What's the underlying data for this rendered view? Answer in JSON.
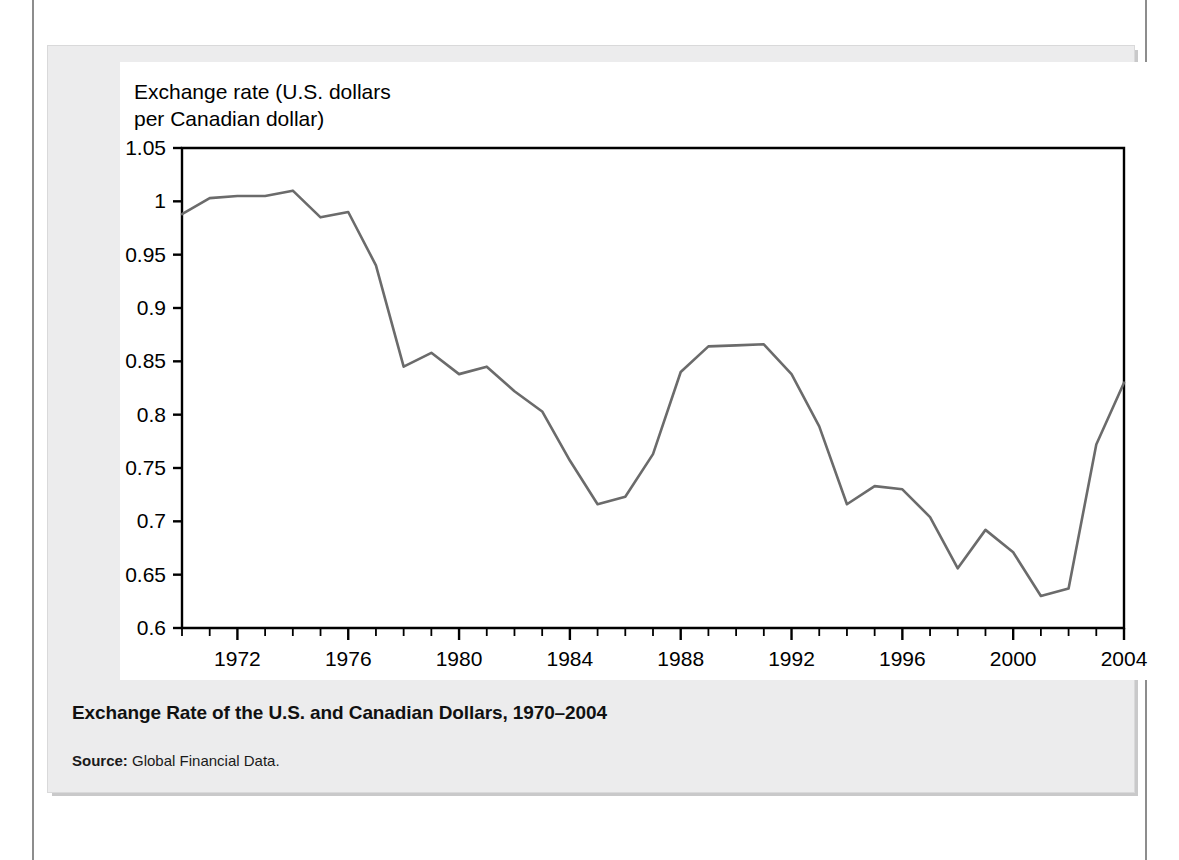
{
  "figure": {
    "axis_title": "Exchange rate (U.S. dollars\nper Canadian dollar)",
    "caption_title": "Exchange Rate of the U.S. and Canadian Dollars, 1970–2004",
    "source_label": "Source:",
    "source_text": "Global Financial Data.",
    "line_color": "#6b6b6b",
    "axis_color": "#000000",
    "panel_color": "#ffffff",
    "box_color": "#ececed"
  },
  "chart_data": {
    "type": "line",
    "title": "Exchange Rate of the U.S. and Canadian Dollars, 1970–2004",
    "xlabel": "",
    "ylabel": "Exchange rate (U.S. dollars per Canadian dollar)",
    "xlim": [
      1970,
      2004
    ],
    "ylim": [
      0.6,
      1.05
    ],
    "ytick_step": 0.05,
    "xtick_major_step": 4,
    "xtick_minor_step": 1,
    "grid": false,
    "legend": null,
    "ytick_labels": [
      "1.05",
      "1",
      "0.95",
      "0.9",
      "0.85",
      "0.8",
      "0.75",
      "0.7",
      "0.65",
      "0.6"
    ],
    "ytick_values": [
      1.05,
      1.0,
      0.95,
      0.9,
      0.85,
      0.8,
      0.75,
      0.7,
      0.65,
      0.6
    ],
    "xtick_labels": [
      "1972",
      "1976",
      "1980",
      "1984",
      "1988",
      "1992",
      "1996",
      "2000",
      "2004"
    ],
    "xtick_values": [
      1972,
      1976,
      1980,
      1984,
      1988,
      1992,
      1996,
      2000,
      2004
    ],
    "series": [
      {
        "name": "U.S. dollars per Canadian dollar",
        "color": "#6b6b6b",
        "x": [
          1970,
          1971,
          1972,
          1973,
          1974,
          1975,
          1976,
          1977,
          1978,
          1979,
          1980,
          1981,
          1982,
          1983,
          1984,
          1985,
          1986,
          1987,
          1988,
          1989,
          1990,
          1991,
          1992,
          1993,
          1994,
          1995,
          1996,
          1997,
          1998,
          1999,
          2000,
          2001,
          2002,
          2003,
          2004
        ],
        "values": [
          0.988,
          1.003,
          1.005,
          1.005,
          1.01,
          0.985,
          0.99,
          0.94,
          0.845,
          0.858,
          0.838,
          0.845,
          0.822,
          0.803,
          0.757,
          0.716,
          0.723,
          0.763,
          0.84,
          0.864,
          0.865,
          0.866,
          0.838,
          0.789,
          0.716,
          0.733,
          0.73,
          0.704,
          0.656,
          0.692,
          0.671,
          0.63,
          0.637,
          0.772,
          0.83
        ]
      }
    ]
  }
}
